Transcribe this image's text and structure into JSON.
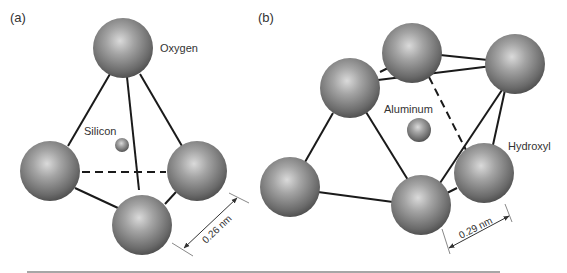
{
  "panels": [
    {
      "id": "a",
      "label": "(a)",
      "structure": "silica tetrahedron",
      "atoms": {
        "outer_label": "Oxygen",
        "center_label": "Silicon"
      },
      "dimension": "0.26 nm"
    },
    {
      "id": "b",
      "label": "(b)",
      "structure": "alumina octahedron",
      "atoms": {
        "outer_label": "Hydroxyl",
        "center_label": "Aluminum"
      },
      "dimension": "0.29 nm"
    }
  ],
  "colors": {
    "sphere_light": "#d8d8d8",
    "sphere_mid": "#8a8a8a",
    "sphere_dark": "#4a4a4a",
    "bond": "#1a1a1a",
    "text": "#333333",
    "rule": "#888888"
  }
}
